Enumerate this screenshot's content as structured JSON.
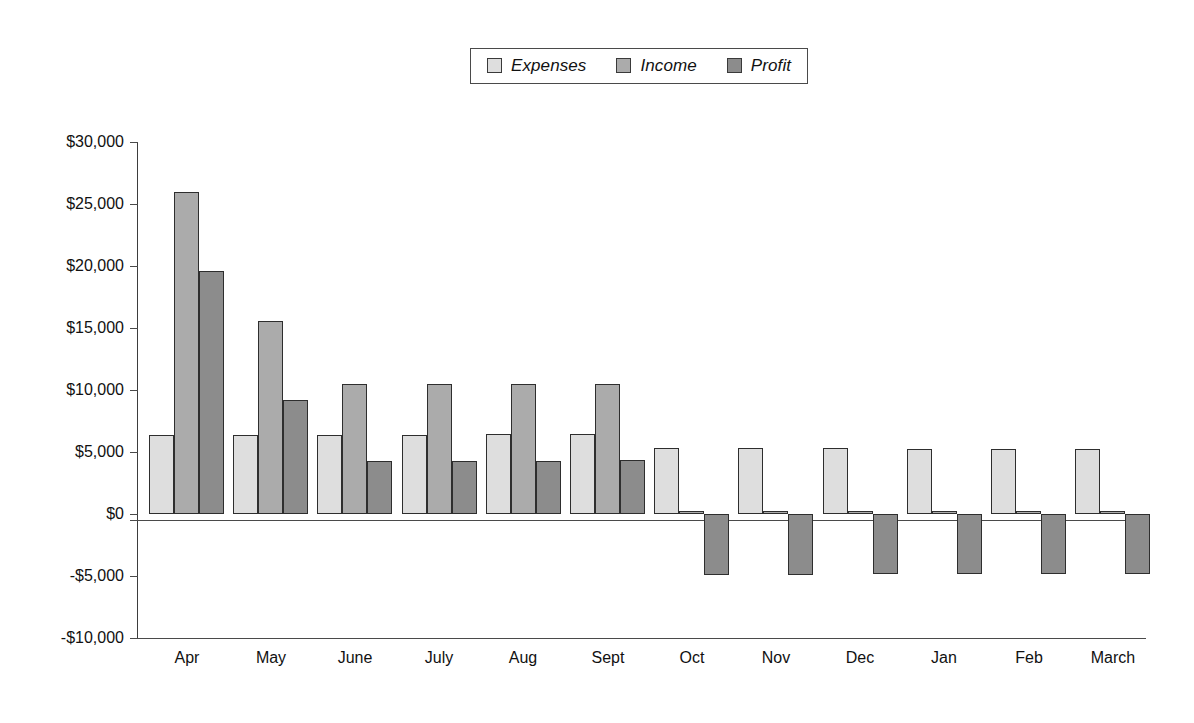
{
  "chart_data": {
    "type": "bar",
    "title": "",
    "xlabel": "",
    "ylabel": "",
    "categories": [
      "Apr",
      "May",
      "June",
      "July",
      "Aug",
      "Sept",
      "Oct",
      "Nov",
      "Dec",
      "Jan",
      "Feb",
      "March"
    ],
    "series": [
      {
        "name": "Expenses",
        "color": "#dedede",
        "values": [
          6400,
          6400,
          6400,
          6400,
          6450,
          6450,
          5300,
          5300,
          5300,
          5250,
          5250,
          5250
        ]
      },
      {
        "name": "Income",
        "color": "#ababab",
        "values": [
          26000,
          15600,
          10450,
          10450,
          10450,
          10450,
          250,
          250,
          250,
          250,
          250,
          250
        ]
      },
      {
        "name": "Profit",
        "color": "#8c8c8c",
        "values": [
          19600,
          9200,
          4300,
          4300,
          4300,
          4350,
          -4900,
          -4900,
          -4800,
          -4800,
          -4800,
          -4800
        ]
      }
    ],
    "ylim": [
      -10000,
      30000
    ],
    "ytick_values": [
      30000,
      25000,
      20000,
      15000,
      10000,
      5000,
      0,
      -5000,
      -10000
    ],
    "ytick_labels": [
      "$30,000",
      "$25,000",
      "$20,000",
      "$15,000",
      "$10,000",
      "$5,000",
      "$0",
      "-$5,000",
      "-$10,000"
    ],
    "grid": false,
    "legend_position": "top-center",
    "legend_entries": [
      "Expenses",
      "Income",
      "Profit"
    ]
  },
  "legend": {
    "items": [
      {
        "label": "Expenses",
        "swatch_name": "legend-swatch-expenses",
        "color": "#dedede"
      },
      {
        "label": "Income",
        "swatch_name": "legend-swatch-income",
        "color": "#ababab"
      },
      {
        "label": "Profit",
        "swatch_name": "legend-swatch-profit",
        "color": "#8c8c8c"
      }
    ]
  }
}
